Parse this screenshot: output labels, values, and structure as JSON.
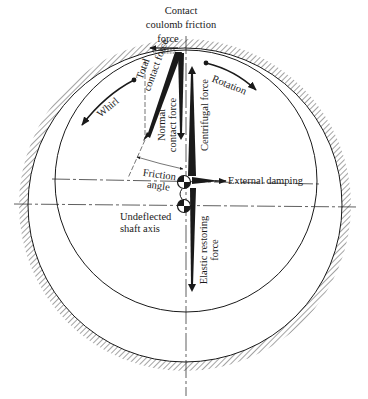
{
  "figure": {
    "type": "rotor-stator rub force diagram",
    "colors": {
      "ink": "#1a1a1a",
      "background": "#ffffff",
      "hatch": "#333333"
    }
  },
  "labels": {
    "friction_force": [
      "Contact",
      "coulomb friction",
      "force"
    ],
    "total_contact_force": [
      "Total",
      "contact force"
    ],
    "normal_contact_force": [
      "Normal",
      "contact force"
    ],
    "centrifugal_force": "Centrifugal force",
    "rotation": "Rotation",
    "whirl": "Whirl",
    "friction_angle": [
      "Friction",
      "angle"
    ],
    "external_damping": "External damping",
    "undeflected_shaft_axis": [
      "Undeflected",
      "shaft axis"
    ],
    "elastic_restoring_force": [
      "Elastic restoring",
      "force"
    ]
  },
  "geometry": {
    "stator": {
      "cx": 185,
      "cy": 205,
      "r": 157
    },
    "rotor": {
      "cx": 186,
      "cy": 181,
      "r": 131
    },
    "deflected_center": {
      "x": 184,
      "y": 182
    },
    "undeflected_center": {
      "x": 184,
      "y": 206
    }
  }
}
